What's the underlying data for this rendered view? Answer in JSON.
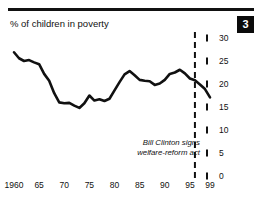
{
  "header": {
    "title": "% of children in poverty",
    "badge": "3"
  },
  "chart_data": {
    "type": "line",
    "title": "% of children in poverty",
    "xlabel": "",
    "ylabel": "",
    "xlim": [
      1960,
      1999
    ],
    "ylim": [
      0,
      30
    ],
    "grid": false,
    "legend": false,
    "x_tick_labels": [
      "1960",
      "65",
      "70",
      "75",
      "80",
      "85",
      "90",
      "95",
      "99"
    ],
    "x_tick_values": [
      1960,
      1965,
      1970,
      1975,
      1980,
      1985,
      1990,
      1995,
      1999
    ],
    "y_tick_labels": [
      "0",
      "5",
      "10",
      "15",
      "20",
      "25",
      "30"
    ],
    "y_tick_values": [
      0,
      5,
      10,
      15,
      20,
      25,
      30
    ],
    "series": [
      {
        "name": "% of children in poverty",
        "color": "#111111",
        "x": [
          1960,
          1961,
          1962,
          1963,
          1964,
          1965,
          1966,
          1967,
          1968,
          1969,
          1970,
          1971,
          1972,
          1973,
          1974,
          1975,
          1976,
          1977,
          1978,
          1979,
          1980,
          1981,
          1982,
          1983,
          1984,
          1985,
          1986,
          1987,
          1988,
          1989,
          1990,
          1991,
          1992,
          1993,
          1994,
          1995,
          1996,
          1997,
          1998,
          1999
        ],
        "values": [
          26.9,
          25.6,
          25.0,
          25.2,
          24.7,
          24.3,
          22.2,
          20.7,
          18.0,
          16.0,
          15.8,
          15.9,
          15.3,
          14.8,
          15.8,
          17.5,
          16.4,
          16.7,
          16.3,
          16.8,
          18.6,
          20.4,
          22.1,
          22.8,
          21.9,
          20.9,
          20.7,
          20.6,
          19.8,
          20.1,
          20.9,
          22.2,
          22.5,
          23.1,
          22.3,
          21.2,
          20.8,
          19.9,
          18.9,
          17.1
        ]
      }
    ],
    "annotations": [
      {
        "name": "welfare-reform-marker",
        "x": 1996,
        "style": "dashed-vertical-line",
        "label_line1": "Bill Clinton signs",
        "label_line2": "welfare-reform act"
      }
    ]
  }
}
